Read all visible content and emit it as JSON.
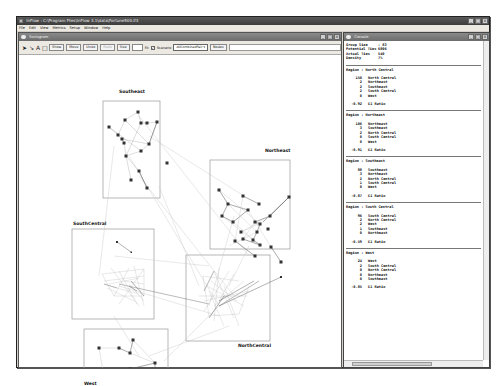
{
  "app": {
    "title": "InFlow : C:\\Program Files\\InFlow 3.1\\data\\Fortune500.if3",
    "menu": [
      "File",
      "Edit",
      "View",
      "Metrics",
      "Setup",
      "Window",
      "Help"
    ],
    "window_buttons": [
      "_",
      "□",
      "×"
    ]
  },
  "graph_window": {
    "title": "Sociogram",
    "toolbar": {
      "tools": [
        "pointer-tool",
        "link-tool",
        "text-tool",
        "box-tool"
      ],
      "tool_glyphs": [
        "➤",
        "↘",
        "A",
        "□"
      ],
      "buttons": [
        "Show",
        "Move",
        "Undo",
        "Redo"
      ],
      "size_label": "Size",
      "size_value": "",
      "checkbox_label": "Fit",
      "scenario_checked": true,
      "scenario_label": "Scenario",
      "select_value": "AllCombinedPair",
      "nodes_button": "Nodes"
    },
    "regions": [
      {
        "name": "Southeast",
        "label_x": 100,
        "label_y": 38,
        "box": [
          84,
          45,
          57,
          97
        ]
      },
      {
        "name": "Northeast",
        "label_x": 247,
        "label_y": 96,
        "box": [
          191,
          104,
          80,
          89
        ]
      },
      {
        "name": "SouthCentral",
        "label_x": 54,
        "label_y": 164,
        "box": [
          53,
          173,
          82,
          90
        ]
      },
      {
        "name": "NorthCentral",
        "label_x": 218,
        "label_y": 288,
        "box": [
          167,
          199,
          84,
          86
        ]
      },
      {
        "name": "West",
        "label_x": 64,
        "label_y": 327,
        "box": [
          65,
          273,
          84,
          50
        ]
      }
    ]
  },
  "console": {
    "title": "Console",
    "summary": [
      {
        "key": "Group Size",
        "value": ": 83"
      },
      {
        "key": "Potential Ties",
        "value": "6806"
      },
      {
        "key": "Actual Ties",
        "value": "540"
      },
      {
        "key": "Density",
        "value": "7%"
      }
    ],
    "regions": [
      {
        "header": "Region : North Central",
        "counts": [
          {
            "n": "150",
            "label": "North Central"
          },
          {
            "n": "2",
            "label": "Northeast"
          },
          {
            "n": "2",
            "label": "Southeast"
          },
          {
            "n": "2",
            "label": "South Central"
          },
          {
            "n": "0",
            "label": "West"
          }
        ],
        "ratio": "-0.92",
        "ratio_label": "EI Ratio"
      },
      {
        "header": "Region : Northeast",
        "counts": [
          {
            "n": "106",
            "label": "Northeast"
          },
          {
            "n": "3",
            "label": "Southeast"
          },
          {
            "n": "2",
            "label": "North Central"
          },
          {
            "n": "0",
            "label": "South Central"
          },
          {
            "n": "0",
            "label": "West"
          }
        ],
        "ratio": "-0.91",
        "ratio_label": "EI Ratio"
      },
      {
        "header": "Region : Southeast",
        "counts": [
          {
            "n": "88",
            "label": "Southeast"
          },
          {
            "n": "3",
            "label": "Northeast"
          },
          {
            "n": "2",
            "label": "North Central"
          },
          {
            "n": "1",
            "label": "South Central"
          },
          {
            "n": "0",
            "label": "West"
          }
        ],
        "ratio": "-0.87",
        "ratio_label": "EI Ratio"
      },
      {
        "header": "Region : South Central",
        "counts": [
          {
            "n": "96",
            "label": "South Central"
          },
          {
            "n": "2",
            "label": "North Central"
          },
          {
            "n": "2",
            "label": "West"
          },
          {
            "n": "1",
            "label": "Southeast"
          },
          {
            "n": "0",
            "label": "Northeast"
          }
        ],
        "ratio": "-0.59",
        "ratio_label": "EI Ratio"
      },
      {
        "header": "Region : West",
        "counts": [
          {
            "n": "24",
            "label": "West"
          },
          {
            "n": "2",
            "label": "South Central"
          },
          {
            "n": "0",
            "label": "North Central"
          },
          {
            "n": "0",
            "label": "Northeast"
          },
          {
            "n": "0",
            "label": "Southeast"
          }
        ],
        "ratio": "-0.85",
        "ratio_label": "EI Ratio"
      }
    ]
  },
  "colors": {
    "title_bar": "#3c3c3c",
    "child_title_bar": "#6c6c6c",
    "chrome": "#d4d0c8",
    "node": "#333333",
    "edge": "#b5b5b5",
    "region_box": "#999999"
  }
}
